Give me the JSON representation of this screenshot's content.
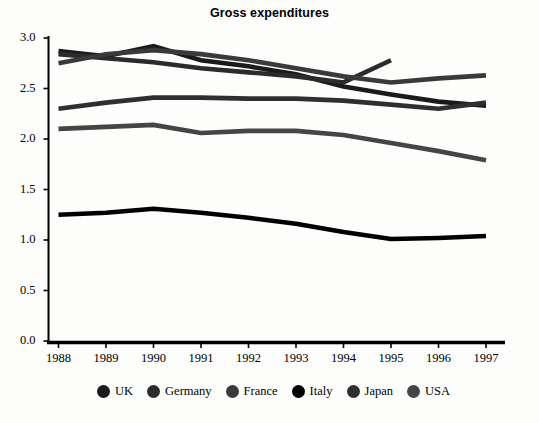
{
  "chart_data": {
    "type": "line",
    "title": "Gross expenditures",
    "xlabel": "",
    "ylabel": "",
    "x": [
      1988,
      1989,
      1990,
      1991,
      1992,
      1993,
      1994,
      1995,
      1996,
      1997
    ],
    "xticklabels": [
      "1988",
      "1989",
      "1990",
      "1991",
      "1992",
      "1993",
      "1994",
      "1995",
      "1996",
      "1997"
    ],
    "yticklabels": [
      "0.0",
      "0.5",
      "1.0",
      "1.5",
      "2.0",
      "2.5",
      "3.0"
    ],
    "yticks": [
      0.0,
      0.5,
      1.0,
      1.5,
      2.0,
      2.5,
      3.0
    ],
    "ylim": [
      0.0,
      3.0
    ],
    "grid": false,
    "legend_position": "bottom",
    "series": [
      {
        "name": "UK",
        "color": "#1a1a1a",
        "values": [
          2.87,
          2.82,
          2.92,
          2.78,
          2.72,
          2.64,
          2.52,
          2.44,
          2.37,
          2.33
        ]
      },
      {
        "name": "Germany",
        "color": "#2b2b2b",
        "values": [
          2.84,
          2.8,
          2.76,
          2.7,
          2.66,
          2.62,
          2.56,
          2.78,
          null,
          null
        ]
      },
      {
        "name": "France",
        "color": "#3a3a3a",
        "values": [
          2.75,
          2.84,
          2.88,
          2.84,
          2.78,
          2.7,
          2.62,
          2.56,
          2.6,
          2.63
        ]
      },
      {
        "name": "Italy",
        "color": "#000000",
        "values": [
          1.25,
          1.27,
          1.31,
          1.27,
          1.22,
          1.16,
          1.08,
          1.01,
          1.02,
          1.04
        ]
      },
      {
        "name": "Japan",
        "color": "#2f2f2f",
        "values": [
          2.3,
          2.36,
          2.41,
          2.41,
          2.4,
          2.4,
          2.38,
          2.34,
          2.3,
          2.36
        ]
      },
      {
        "name": "USA",
        "color": "#454545",
        "values": [
          2.1,
          2.12,
          2.14,
          2.06,
          2.08,
          2.08,
          2.04,
          1.96,
          1.88,
          1.79
        ]
      }
    ]
  },
  "legend": {
    "items": [
      {
        "label": "UK"
      },
      {
        "label": "Germany"
      },
      {
        "label": "France"
      },
      {
        "label": "Italy"
      },
      {
        "label": "Japan"
      },
      {
        "label": "USA"
      }
    ]
  }
}
